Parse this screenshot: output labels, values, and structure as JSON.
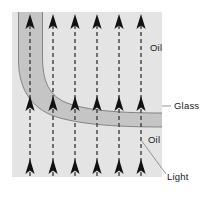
{
  "figure": {
    "type": "physics-optics-diagram",
    "canvas": {
      "width": 207,
      "height": 197
    },
    "colors": {
      "page_background": "#ffffff",
      "medium_background": "#e4e4e4",
      "glass_fill": "#c3c3c3",
      "glass_outline": "#6f6f6f",
      "ray_line": "#4a4a4a",
      "arrow_head": "#111111",
      "leader_line": "#8a8a8a",
      "label_text": "#1a1a1a"
    }
  },
  "regions": [
    {
      "id": "oil-medium",
      "name": "Oil",
      "description": "Light gray field filling the frame, representing oil surrounding the glass",
      "x": 12,
      "y": 12,
      "width": 150,
      "height": 165
    },
    {
      "id": "glass-band",
      "name": "Glass",
      "description": "Darker gray curved band of glass that bends from vertical at the upper left to horizontal at the right"
    }
  ],
  "labels": [
    {
      "id": "label-oil-top",
      "text": "Oil",
      "x": 150,
      "y": 51,
      "anchor": "start",
      "leader": false
    },
    {
      "id": "label-glass",
      "text": "Glass",
      "x": 174,
      "y": 107,
      "anchor": "start",
      "leader": true
    },
    {
      "id": "label-oil-lower",
      "text": "Oil",
      "x": 148,
      "y": 143,
      "anchor": "start",
      "leader": false
    },
    {
      "id": "label-light",
      "text": "Light",
      "x": 167,
      "y": 177,
      "anchor": "start",
      "leader": true
    }
  ],
  "rays": {
    "count": 6,
    "direction": "upward",
    "style": "dashed",
    "description": "Six parallel upward light rays traversing the oil and the glass band",
    "x_positions": [
      30,
      53,
      75,
      97,
      119,
      141
    ],
    "arrowhead_rows_y": [
      16,
      98,
      161
    ]
  },
  "leaders": [
    {
      "id": "leader-glass",
      "from_x": 162,
      "from_y": 106,
      "to_x": 171,
      "to_y": 106
    },
    {
      "id": "leader-light",
      "from_x": 141,
      "from_y": 140,
      "to_x": 166,
      "to_y": 174
    }
  ]
}
